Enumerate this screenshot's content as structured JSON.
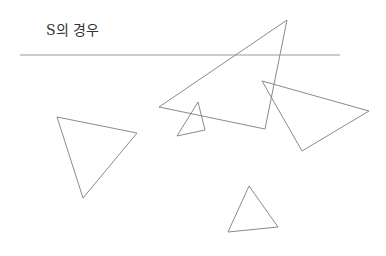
{
  "title": "S의 경우",
  "colors": {
    "stroke": "#8a8a8a",
    "rule": "#9a9a9a",
    "text": "#333333",
    "background": "#ffffff"
  },
  "rule": {
    "x1": 20,
    "y1": 55,
    "x2": 340,
    "y2": 55
  },
  "triangles": [
    {
      "name": "large-triangle",
      "points": "287,20 159,107 265,129"
    },
    {
      "name": "right-triangle",
      "points": "262,81 369,111 302,151"
    },
    {
      "name": "small-triangle",
      "points": "198,102 177,136 205,130"
    },
    {
      "name": "left-triangle",
      "points": "57,117 137,133 83,198"
    },
    {
      "name": "bottom-triangle",
      "points": "249,186 228,232 278,227"
    }
  ]
}
